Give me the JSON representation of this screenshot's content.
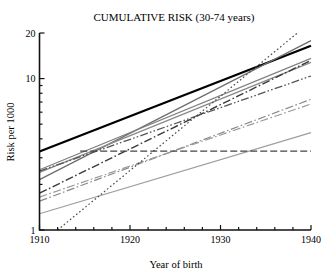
{
  "chart_data": {
    "type": "line",
    "title": "CUMULATIVE RISK (30-74 years)",
    "xlabel": "Year of birth",
    "ylabel": "Risk per 1000",
    "yscale": "log",
    "xlim": [
      1910,
      1940
    ],
    "ylim": [
      1,
      20
    ],
    "grid": false,
    "legend": null,
    "xticks": [
      1910,
      1920,
      1930,
      1940
    ],
    "xtick_labels": [
      "1910",
      "1920",
      "1930",
      "1940"
    ],
    "xminor_step": 2,
    "yticks": [
      1,
      10,
      20
    ],
    "ytick_labels": [
      "1",
      "10",
      "20"
    ],
    "yminor_ticks": [
      2,
      3,
      4,
      5,
      6,
      7,
      8,
      9
    ],
    "x": [
      1910,
      1940
    ],
    "series": [
      {
        "name": "series-1-bold-black",
        "style": "solid",
        "color": "#000000",
        "width": 2.2,
        "x": [
          1910,
          1940
        ],
        "values": [
          3.3,
          16.5
        ]
      },
      {
        "name": "series-2-gray-steep",
        "style": "solid",
        "color": "#6e6e6e",
        "width": 1.3,
        "x": [
          1910,
          1940
        ],
        "values": [
          2.15,
          17.8
        ]
      },
      {
        "name": "series-3-gray",
        "style": "solid",
        "color": "#808080",
        "width": 1.2,
        "x": [
          1910,
          1940
        ],
        "values": [
          2.5,
          13.6
        ]
      },
      {
        "name": "series-4-gray",
        "style": "solid",
        "color": "#888888",
        "width": 1.2,
        "x": [
          1910,
          1940
        ],
        "values": [
          2.4,
          12.8
        ]
      },
      {
        "name": "series-5-dashdot-dark",
        "style": "dashdot",
        "color": "#3a3a3a",
        "width": 1.4,
        "x": [
          1910,
          1940
        ],
        "values": [
          1.75,
          13.2
        ]
      },
      {
        "name": "series-6-dashdotdot",
        "style": "dashdotdot",
        "color": "#555555",
        "width": 1.3,
        "x": [
          1910,
          1940
        ],
        "values": [
          2.45,
          10.4
        ]
      },
      {
        "name": "series-7-dashdot-gray",
        "style": "dashdot",
        "color": "#8a8a8a",
        "width": 1.2,
        "x": [
          1910,
          1940
        ],
        "values": [
          1.55,
          7.3
        ]
      },
      {
        "name": "series-8-dashdot-light",
        "style": "dashdot",
        "color": "#9a9a9a",
        "width": 1.2,
        "x": [
          1910,
          1940
        ],
        "values": [
          1.65,
          6.8
        ]
      },
      {
        "name": "series-9-gray-shallow",
        "style": "solid",
        "color": "#9e9e9e",
        "width": 1.2,
        "x": [
          1910,
          1940
        ],
        "values": [
          1.28,
          4.4
        ]
      },
      {
        "name": "series-10-dotted-steep",
        "style": "dotted",
        "color": "#4a4a4a",
        "width": 1.2,
        "x": [
          1912,
          1938.5
        ],
        "values": [
          1.0,
          20.0
        ]
      },
      {
        "name": "series-11-dashed-flat",
        "style": "dashed",
        "color": "#444444",
        "width": 1.3,
        "x": [
          1914.5,
          1940
        ],
        "values": [
          3.32,
          3.32
        ]
      }
    ],
    "annotations": []
  },
  "axes": {
    "title": "CUMULATIVE RISK (30-74 years)",
    "x_label": "Year of birth",
    "y_label": "Risk per 1000"
  }
}
